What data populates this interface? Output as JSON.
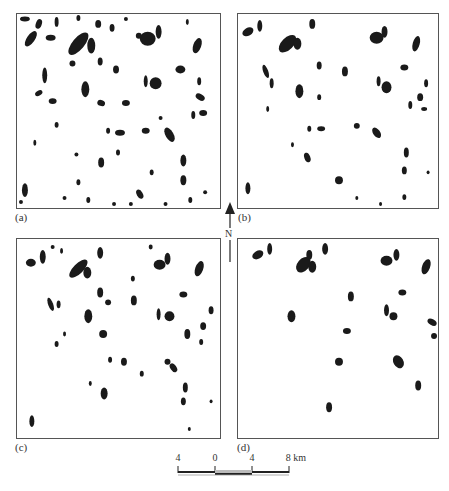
{
  "figure": {
    "panels": [
      {
        "id": "a",
        "label": "(a)",
        "density": "high"
      },
      {
        "id": "b",
        "label": "(b)",
        "density": "medium-high"
      },
      {
        "id": "c",
        "label": "(c)",
        "density": "medium"
      },
      {
        "id": "d",
        "label": "(d)",
        "density": "low"
      }
    ],
    "north_arrow": {
      "label": "N",
      "icon": "north-arrow-icon"
    },
    "scale_bar": {
      "ticks": [
        "4",
        "0",
        "4",
        "8 km"
      ],
      "unit": "km"
    },
    "colors": {
      "blob": "#1a1a1a",
      "frame": "#555555",
      "background": "#ffffff"
    }
  }
}
